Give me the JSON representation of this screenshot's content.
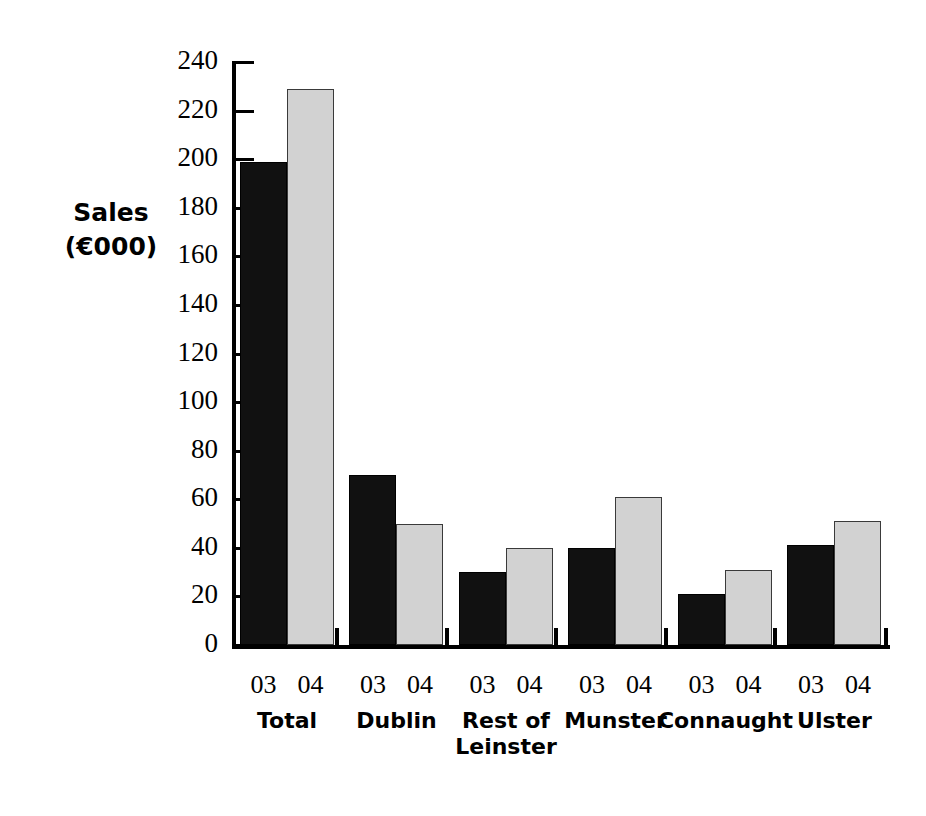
{
  "chart_data": {
    "type": "bar",
    "title": "",
    "subtitle": "",
    "xlabel": "",
    "ylabel": "Sales (€000)",
    "ylabel_line1": "Sales",
    "ylabel_line2": "(€000)",
    "ylim": [
      0,
      240
    ],
    "ytick_step": 20,
    "yticks": [
      0,
      20,
      40,
      60,
      80,
      100,
      120,
      140,
      160,
      180,
      200,
      220,
      240
    ],
    "ytick_labels": [
      "0",
      "20",
      "40",
      "60",
      "80",
      "100",
      "120",
      "140",
      "160",
      "180",
      "200",
      "220",
      "240"
    ],
    "grid": false,
    "legend": "none",
    "categories": [
      "Total",
      "Dublin",
      "Rest of Leinster",
      "Munster",
      "Connaught",
      "Ulster"
    ],
    "category_labels": [
      {
        "line1": "Total",
        "line2": ""
      },
      {
        "line1": "Dublin",
        "line2": ""
      },
      {
        "line1": "Rest of",
        "line2": "Leinster"
      },
      {
        "line1": "Munster",
        "line2": ""
      },
      {
        "line1": "Connaught",
        "line2": ""
      },
      {
        "line1": "Ulster",
        "line2": ""
      }
    ],
    "series": [
      {
        "name": "03",
        "color": "#111111",
        "values": [
          199,
          70,
          30,
          40,
          21,
          41
        ]
      },
      {
        "name": "04",
        "color": "#d2d2d2",
        "values": [
          229,
          50,
          40,
          61,
          31,
          51
        ]
      }
    ],
    "year_labels": [
      "03",
      "04"
    ],
    "axis_color": "#000000"
  }
}
